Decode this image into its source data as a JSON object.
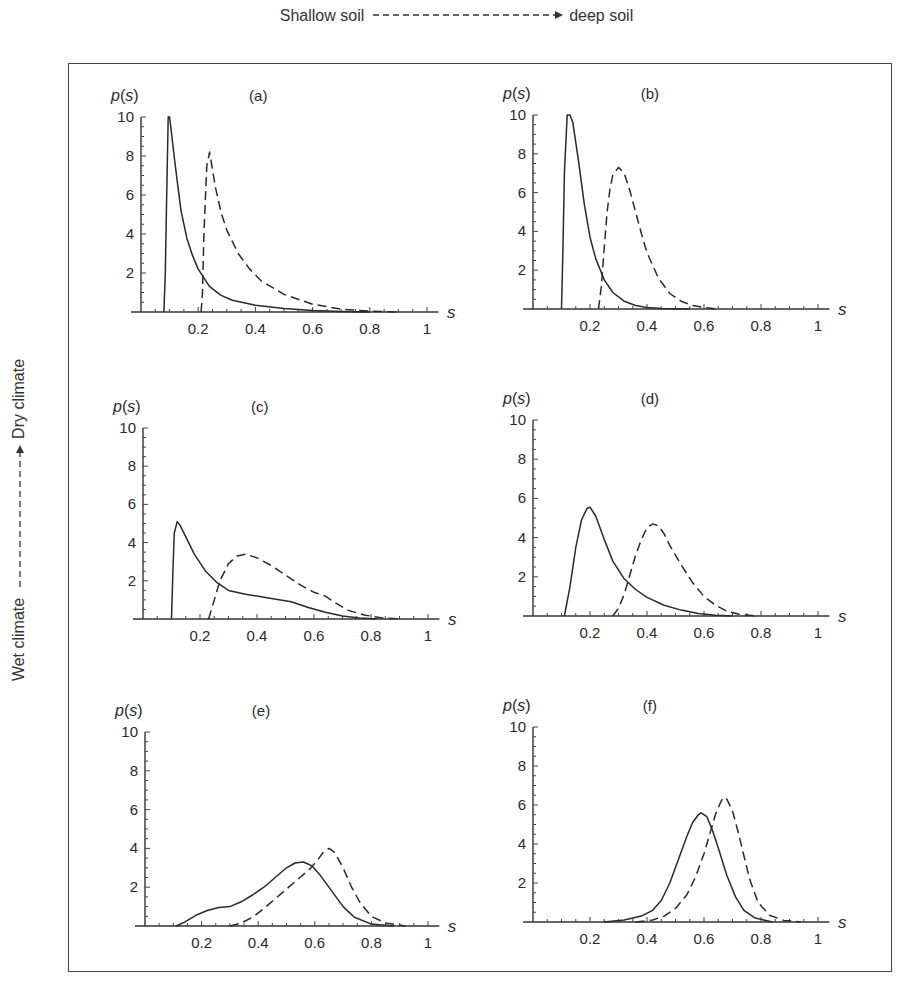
{
  "figure": {
    "top_axis": {
      "left_label": "Shallow soil",
      "right_label": "deep soil",
      "arrow": "dashed-right-arrow"
    },
    "side_axis": {
      "bottom_label": "Wet climate",
      "top_label": "Dry climate",
      "arrow": "dashed-up-arrow"
    }
  },
  "chart_data": [
    {
      "panel": "(a)",
      "type": "line",
      "title": "(a)",
      "xlabel": "s",
      "ylabel": "p(s)",
      "xlim": [
        0,
        1
      ],
      "ylim": [
        0,
        10
      ],
      "grid": false,
      "xticks": [
        "0.2",
        "0.4",
        "0.6",
        "0.8",
        "1"
      ],
      "yticks": [
        "2",
        "4",
        "6",
        "8",
        "10"
      ],
      "series": [
        {
          "name": "shallow soil (solid)",
          "style": "solid",
          "x": [
            0.08,
            0.085,
            0.09,
            0.095,
            0.1,
            0.12,
            0.14,
            0.16,
            0.18,
            0.2,
            0.24,
            0.28,
            0.32,
            0.4,
            0.5,
            0.6,
            0.7,
            0.8
          ],
          "y": [
            0,
            2,
            6,
            10,
            10,
            7.5,
            5.2,
            3.8,
            2.9,
            2.2,
            1.3,
            0.85,
            0.6,
            0.35,
            0.18,
            0.08,
            0.03,
            0
          ]
        },
        {
          "name": "deep soil (dashed)",
          "style": "dashed",
          "x": [
            0.21,
            0.215,
            0.22,
            0.23,
            0.24,
            0.26,
            0.28,
            0.3,
            0.34,
            0.38,
            0.42,
            0.5,
            0.6,
            0.7,
            0.8,
            0.9
          ],
          "y": [
            0,
            1,
            4,
            7.5,
            8.2,
            6.4,
            5.1,
            4.2,
            3.0,
            2.2,
            1.6,
            0.9,
            0.4,
            0.15,
            0.04,
            0
          ]
        }
      ]
    },
    {
      "panel": "(b)",
      "type": "line",
      "title": "(b)",
      "xlabel": "s",
      "ylabel": "p(s)",
      "xlim": [
        0,
        1
      ],
      "ylim": [
        0,
        10
      ],
      "grid": false,
      "xticks": [
        "0.2",
        "0.4",
        "0.6",
        "0.8",
        "1"
      ],
      "yticks": [
        "2",
        "4",
        "6",
        "8",
        "10"
      ],
      "series": [
        {
          "name": "shallow soil (solid)",
          "style": "solid",
          "x": [
            0.1,
            0.105,
            0.11,
            0.12,
            0.13,
            0.14,
            0.16,
            0.18,
            0.2,
            0.22,
            0.25,
            0.28,
            0.32,
            0.36,
            0.4,
            0.45,
            0.55
          ],
          "y": [
            0,
            3,
            7,
            10,
            10,
            9.6,
            7.6,
            5.4,
            3.7,
            2.6,
            1.5,
            0.85,
            0.4,
            0.18,
            0.08,
            0.03,
            0
          ]
        },
        {
          "name": "deep soil (dashed)",
          "style": "dashed",
          "x": [
            0.23,
            0.24,
            0.25,
            0.26,
            0.27,
            0.28,
            0.3,
            0.32,
            0.34,
            0.36,
            0.38,
            0.4,
            0.44,
            0.48,
            0.52,
            0.56,
            0.6,
            0.65
          ],
          "y": [
            0,
            1.2,
            3.2,
            5.0,
            6.2,
            6.9,
            7.3,
            7.0,
            6.1,
            5.0,
            3.9,
            2.9,
            1.6,
            0.8,
            0.4,
            0.18,
            0.07,
            0
          ]
        }
      ]
    },
    {
      "panel": "(c)",
      "type": "line",
      "title": "(c)",
      "xlabel": "s",
      "ylabel": "p(s)",
      "xlim": [
        0,
        1
      ],
      "ylim": [
        0,
        10
      ],
      "grid": false,
      "xticks": [
        "0.2",
        "0.4",
        "0.6",
        "0.8",
        "1"
      ],
      "yticks": [
        "2",
        "4",
        "6",
        "8",
        "10"
      ],
      "series": [
        {
          "name": "shallow soil (solid)",
          "style": "solid",
          "x": [
            0.1,
            0.105,
            0.11,
            0.12,
            0.13,
            0.15,
            0.18,
            0.22,
            0.26,
            0.3,
            0.36,
            0.44,
            0.52,
            0.58,
            0.64,
            0.7,
            0.76,
            0.82
          ],
          "y": [
            0,
            2.5,
            4.5,
            5.1,
            4.9,
            4.3,
            3.4,
            2.5,
            1.9,
            1.5,
            1.3,
            1.1,
            0.9,
            0.6,
            0.35,
            0.15,
            0.05,
            0
          ]
        },
        {
          "name": "deep soil (dashed)",
          "style": "dashed",
          "x": [
            0.23,
            0.25,
            0.27,
            0.3,
            0.33,
            0.36,
            0.4,
            0.45,
            0.5,
            0.55,
            0.6,
            0.64,
            0.68,
            0.72,
            0.78,
            0.84,
            0.9
          ],
          "y": [
            0,
            1.0,
            2.0,
            2.9,
            3.3,
            3.4,
            3.2,
            2.8,
            2.3,
            1.8,
            1.4,
            1.2,
            0.8,
            0.45,
            0.2,
            0.06,
            0
          ]
        }
      ]
    },
    {
      "panel": "(d)",
      "type": "line",
      "title": "(d)",
      "xlabel": "s",
      "ylabel": "p(s)",
      "xlim": [
        0,
        1
      ],
      "ylim": [
        0,
        10
      ],
      "grid": false,
      "xticks": [
        "0.2",
        "0.4",
        "0.6",
        "0.8",
        "1"
      ],
      "yticks": [
        "2",
        "4",
        "6",
        "8",
        "10"
      ],
      "series": [
        {
          "name": "shallow soil (solid)",
          "style": "solid",
          "x": [
            0.11,
            0.13,
            0.15,
            0.17,
            0.19,
            0.2,
            0.22,
            0.25,
            0.28,
            0.32,
            0.36,
            0.4,
            0.46,
            0.52,
            0.58,
            0.64,
            0.7
          ],
          "y": [
            0,
            1.5,
            3.5,
            4.9,
            5.5,
            5.55,
            5.1,
            3.9,
            2.8,
            1.9,
            1.35,
            0.95,
            0.55,
            0.3,
            0.13,
            0.04,
            0
          ]
        },
        {
          "name": "deep soil (dashed)",
          "style": "dashed",
          "x": [
            0.28,
            0.3,
            0.32,
            0.34,
            0.36,
            0.38,
            0.4,
            0.42,
            0.44,
            0.46,
            0.48,
            0.52,
            0.56,
            0.6,
            0.64,
            0.68,
            0.72,
            0.78
          ],
          "y": [
            0,
            0.4,
            1.1,
            2.1,
            3.1,
            3.9,
            4.5,
            4.7,
            4.6,
            4.2,
            3.6,
            2.6,
            1.7,
            1.0,
            0.55,
            0.25,
            0.1,
            0
          ]
        }
      ]
    },
    {
      "panel": "(e)",
      "type": "line",
      "title": "(e)",
      "xlabel": "s",
      "ylabel": "p(s)",
      "xlim": [
        0,
        1
      ],
      "ylim": [
        0,
        10
      ],
      "grid": false,
      "xticks": [
        "0.2",
        "0.4",
        "0.6",
        "0.8",
        "1"
      ],
      "yticks": [
        "2",
        "4",
        "6",
        "8",
        "10"
      ],
      "series": [
        {
          "name": "shallow soil (solid)",
          "style": "solid",
          "x": [
            0.11,
            0.14,
            0.18,
            0.22,
            0.26,
            0.3,
            0.34,
            0.38,
            0.42,
            0.46,
            0.5,
            0.53,
            0.56,
            0.59,
            0.62,
            0.66,
            0.7,
            0.74,
            0.8,
            0.88
          ],
          "y": [
            0,
            0.2,
            0.55,
            0.8,
            0.95,
            1.0,
            1.25,
            1.6,
            2.0,
            2.5,
            3.0,
            3.25,
            3.3,
            3.1,
            2.6,
            1.8,
            1.0,
            0.45,
            0.1,
            0
          ]
        },
        {
          "name": "deep soil (dashed)",
          "style": "dashed",
          "x": [
            0.3,
            0.34,
            0.38,
            0.42,
            0.46,
            0.5,
            0.54,
            0.58,
            0.61,
            0.63,
            0.65,
            0.67,
            0.7,
            0.73,
            0.76,
            0.8,
            0.85,
            0.92
          ],
          "y": [
            0,
            0.15,
            0.45,
            0.9,
            1.4,
            1.9,
            2.4,
            2.9,
            3.4,
            3.8,
            4.0,
            3.8,
            3.0,
            2.0,
            1.2,
            0.5,
            0.15,
            0
          ]
        }
      ]
    },
    {
      "panel": "(f)",
      "type": "line",
      "title": "(f)",
      "xlabel": "s",
      "ylabel": "p(s)",
      "xlim": [
        0,
        1
      ],
      "ylim": [
        0,
        10
      ],
      "grid": false,
      "xticks": [
        "0.2",
        "0.4",
        "0.6",
        "0.8",
        "1"
      ],
      "yticks": [
        "2",
        "4",
        "6",
        "8",
        "10"
      ],
      "series": [
        {
          "name": "shallow soil (solid)",
          "style": "solid",
          "x": [
            0.25,
            0.32,
            0.38,
            0.42,
            0.45,
            0.48,
            0.51,
            0.54,
            0.56,
            0.58,
            0.59,
            0.61,
            0.63,
            0.65,
            0.68,
            0.71,
            0.74,
            0.78,
            0.84
          ],
          "y": [
            0,
            0.1,
            0.3,
            0.6,
            1.1,
            2.0,
            3.2,
            4.4,
            5.1,
            5.5,
            5.6,
            5.4,
            4.7,
            3.8,
            2.4,
            1.3,
            0.6,
            0.2,
            0
          ]
        },
        {
          "name": "deep soil (dashed)",
          "style": "dashed",
          "x": [
            0.36,
            0.42,
            0.46,
            0.5,
            0.54,
            0.57,
            0.6,
            0.62,
            0.64,
            0.66,
            0.67,
            0.68,
            0.7,
            0.72,
            0.74,
            0.76,
            0.79,
            0.83,
            0.88,
            0.94
          ],
          "y": [
            0,
            0.1,
            0.3,
            0.7,
            1.4,
            2.3,
            3.5,
            4.5,
            5.5,
            6.2,
            6.4,
            6.3,
            5.7,
            4.6,
            3.4,
            2.2,
            1.0,
            0.35,
            0.08,
            0
          ]
        }
      ]
    }
  ]
}
